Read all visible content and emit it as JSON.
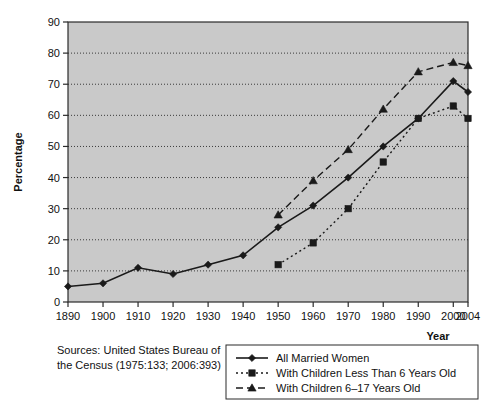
{
  "chart_data": {
    "type": "line",
    "title": "",
    "xlabel": "Year",
    "ylabel": "Percentage",
    "categories": [
      "1890",
      "1900",
      "1910",
      "1920",
      "1930",
      "1940",
      "1950",
      "1960",
      "1970",
      "1980",
      "1990",
      "2000",
      "2004"
    ],
    "xtick_labels": [
      "1890",
      "1900",
      "1910",
      "1920",
      "1930",
      "1940",
      "1950",
      "1960",
      "1970",
      "1980",
      "1990",
      "2000",
      "2004"
    ],
    "ytick_labels": [
      "0",
      "10",
      "20",
      "30",
      "40",
      "50",
      "60",
      "70",
      "80",
      "90"
    ],
    "ylim": [
      0,
      90
    ],
    "ytick_step": 10,
    "grid": true,
    "grid_style": "dotted-horizontal",
    "plot_background": "#c9c9c9",
    "legend_position": "below-right",
    "series": [
      {
        "name": "All Married Women",
        "marker": "diamond",
        "line_style": "solid",
        "color": "#1a1a1a",
        "values": [
          5,
          6,
          11,
          9,
          12,
          15,
          24,
          31,
          40,
          50,
          59,
          71,
          67.5
        ]
      },
      {
        "name": "With Children Less Than 6 Years Old",
        "marker": "square",
        "line_style": "dotted",
        "color": "#1a1a1a",
        "values": [
          null,
          null,
          null,
          null,
          null,
          null,
          12,
          19,
          30,
          45,
          59,
          63,
          59
        ]
      },
      {
        "name": "With Children 6–17 Years Old",
        "marker": "triangle",
        "line_style": "dashed",
        "color": "#1a1a1a",
        "values": [
          null,
          null,
          null,
          null,
          null,
          null,
          28,
          39,
          49,
          62,
          74,
          77,
          76
        ]
      }
    ],
    "source_note_lines": [
      "Sources: United States Bureau of",
      "the Census (1975:133; 2006:393)"
    ]
  }
}
